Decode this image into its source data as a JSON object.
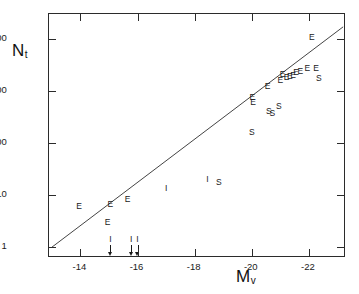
{
  "figure": {
    "background_color": "#ffffff",
    "foreground_color": "#1a1a1a"
  },
  "chart_data": {
    "type": "scatter",
    "title": "",
    "subtitle": "",
    "xlabel": "M_v",
    "xlabel_base": "M",
    "xlabel_sub": "v",
    "ylabel": "N_t",
    "ylabel_base": "N",
    "ylabel_sub": "t",
    "yscale": "log",
    "xscale": "linear",
    "xlim": [
      -12.9,
      -23.3
    ],
    "ylim": [
      0.62,
      30000
    ],
    "grid": false,
    "legend": "none",
    "x_ticks": [
      -14,
      -16,
      -18,
      -20,
      -22
    ],
    "x_tick_labels": [
      "-14",
      "-16",
      "-18",
      "-20",
      "-22"
    ],
    "y_ticks": [
      1,
      10,
      100,
      1000,
      10000
    ],
    "y_tick_labels": [
      "1",
      "10",
      "100",
      "1000",
      "10,000"
    ],
    "marker_encoding": {
      "E": "elliptical galaxy",
      "S": "spiral galaxy",
      "I": "irregular galaxy"
    },
    "fit_line": {
      "label": "",
      "x_start": -13.0,
      "y_start": 1.0,
      "x_end": -23.2,
      "y_end": 17000
    },
    "points": [
      {
        "label": "E",
        "x": -13.95,
        "y": 6.2
      },
      {
        "label": "E",
        "x": -14.95,
        "y": 3.1
      },
      {
        "label": "E",
        "x": -15.05,
        "y": 6.8
      },
      {
        "label": "E",
        "x": -15.65,
        "y": 8.3
      },
      {
        "label": "I",
        "x": -17.0,
        "y": 13.5
      },
      {
        "label": "I",
        "x": -18.45,
        "y": 20.0
      },
      {
        "label": "S",
        "x": -18.85,
        "y": 18.0
      },
      {
        "label": "S",
        "x": -20.0,
        "y": 160
      },
      {
        "label": "E",
        "x": -20.02,
        "y": 760
      },
      {
        "label": "E",
        "x": -20.05,
        "y": 600
      },
      {
        "label": "S",
        "x": -20.6,
        "y": 420
      },
      {
        "label": "S",
        "x": -20.72,
        "y": 380
      },
      {
        "label": "S",
        "x": -20.95,
        "y": 520
      },
      {
        "label": "E",
        "x": -20.55,
        "y": 1250
      },
      {
        "label": "E",
        "x": -21.0,
        "y": 1600
      },
      {
        "label": "E",
        "x": -21.08,
        "y": 2100
      },
      {
        "label": "E",
        "x": -21.22,
        "y": 1850
      },
      {
        "label": "E",
        "x": -21.33,
        "y": 1950
      },
      {
        "label": "E",
        "x": -21.45,
        "y": 2050
      },
      {
        "label": "E",
        "x": -21.55,
        "y": 2300
      },
      {
        "label": "E",
        "x": -21.7,
        "y": 2450
      },
      {
        "label": "E",
        "x": -21.95,
        "y": 2700
      },
      {
        "label": "E",
        "x": -22.25,
        "y": 2800
      },
      {
        "label": "S",
        "x": -22.35,
        "y": 1800
      },
      {
        "label": "E",
        "x": -22.1,
        "y": 11000
      }
    ],
    "upper_limits": [
      {
        "label": "I",
        "x": -15.05,
        "y": 1.0
      },
      {
        "label": "I",
        "x": -15.78,
        "y": 1.0
      },
      {
        "label": "I",
        "x": -16.0,
        "y": 1.0
      }
    ]
  }
}
